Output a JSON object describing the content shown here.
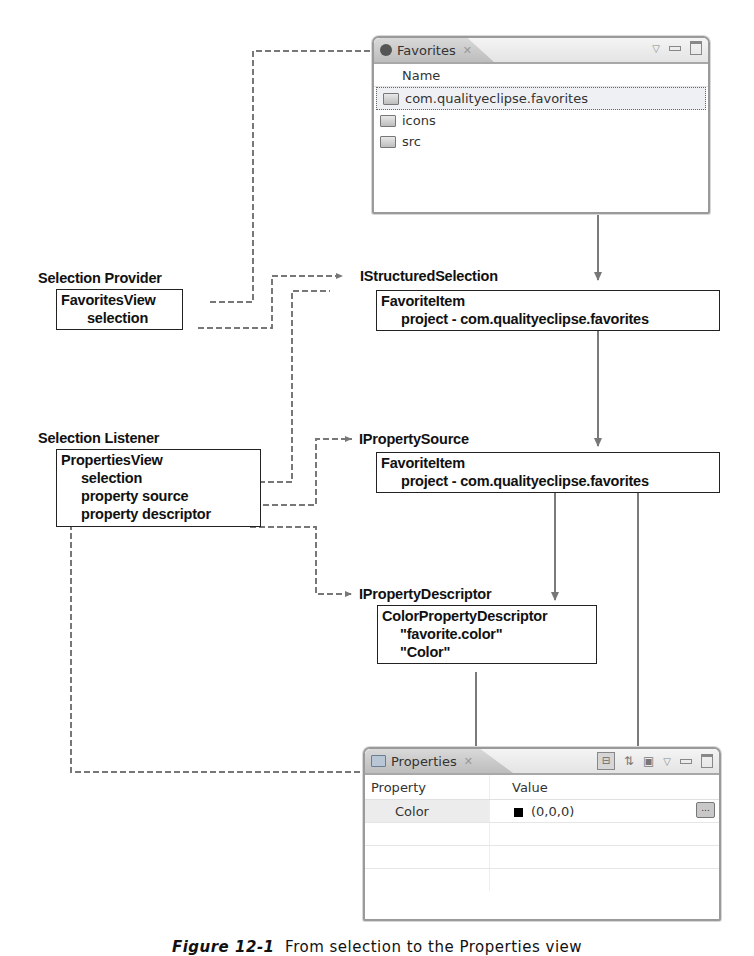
{
  "favorites_view": {
    "tab_title": "Favorites",
    "column_header": "Name",
    "items": [
      {
        "label": "com.qualityeclipse.favorites",
        "selected": true
      },
      {
        "label": "icons",
        "selected": false
      },
      {
        "label": "src",
        "selected": false
      }
    ]
  },
  "selection_provider": {
    "heading": "Selection Provider",
    "box_lines": [
      "FavoritesView",
      "selection"
    ]
  },
  "structured_selection": {
    "heading": "IStructuredSelection",
    "box_lines": [
      "FavoriteItem",
      "project - com.qualityeclipse.favorites"
    ]
  },
  "selection_listener": {
    "heading": "Selection Listener",
    "box_lines": [
      "PropertiesView",
      "selection",
      "property source",
      "property descriptor"
    ]
  },
  "property_source": {
    "heading": "IPropertySource",
    "box_lines": [
      "FavoriteItem",
      "project - com.qualityeclipse.favorites"
    ]
  },
  "property_descriptor": {
    "heading": "IPropertyDescriptor",
    "box_lines": [
      "ColorPropertyDescriptor",
      "\"favorite.color\"",
      "\"Color\""
    ]
  },
  "properties_view": {
    "tab_title": "Properties",
    "columns": [
      "Property",
      "Value"
    ],
    "rows": [
      {
        "property": "Color",
        "value": "(0,0,0)",
        "swatch_color": "#000000",
        "button_label": "..."
      }
    ]
  },
  "caption": {
    "label": "Figure 12-1",
    "text": "From selection to the Properties view"
  },
  "colors": {
    "solid_arrow": "#7a7a7a",
    "dashed_connector": "#777777",
    "box_border": "#222222"
  }
}
